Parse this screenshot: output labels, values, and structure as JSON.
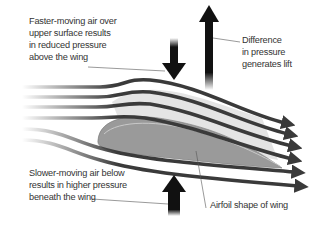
{
  "labels": {
    "upper": "Faster-moving air over\nupper surface results\nin reduced pressure\nabove the wing",
    "lift": "Difference\nin pressure\ngenerates lift",
    "lower": "Slower-moving air below\nresults in higher pressure\nbeneath the wing",
    "airfoil": "Airfoil shape of wing"
  },
  "colors": {
    "streamline": "#3a3a3a",
    "arrow": "#111111",
    "airfoil_top": "#d0d0d0",
    "airfoil_bottom": "#9a9a9a",
    "text": "#333333"
  },
  "streamline_count": 6
}
